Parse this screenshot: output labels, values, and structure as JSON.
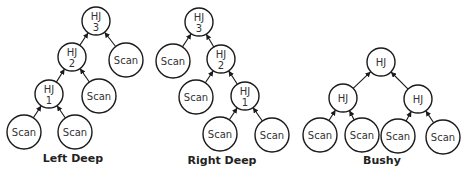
{
  "diagram": {
    "colors": {
      "stroke": "#1a1a1a",
      "text": "#333333",
      "background": "#ffffff"
    },
    "trees": [
      {
        "id": "left-deep",
        "caption": "Left Deep",
        "caption_pos": [
          73,
          162
        ],
        "nodes": [
          {
            "id": "hj3",
            "line1": "HJ",
            "line2": "3",
            "x": 96,
            "y": 21,
            "r": 14
          },
          {
            "id": "hj2",
            "line1": "HJ",
            "line2": "2",
            "x": 72,
            "y": 57,
            "r": 14
          },
          {
            "id": "scan_a",
            "line1": "Scan",
            "line2": "",
            "x": 126,
            "y": 60,
            "r": 17
          },
          {
            "id": "hj1",
            "line1": "HJ",
            "line2": "1",
            "x": 49,
            "y": 94,
            "r": 14
          },
          {
            "id": "scan_b",
            "line1": "Scan",
            "line2": "",
            "x": 99,
            "y": 96,
            "r": 17
          },
          {
            "id": "scan_c",
            "line1": "Scan",
            "line2": "",
            "x": 24,
            "y": 132,
            "r": 17
          },
          {
            "id": "scan_d",
            "line1": "Scan",
            "line2": "",
            "x": 75,
            "y": 132,
            "r": 17
          }
        ],
        "edges": [
          [
            "hj2",
            "hj3"
          ],
          [
            "scan_a",
            "hj3"
          ],
          [
            "hj1",
            "hj2"
          ],
          [
            "scan_b",
            "hj2"
          ],
          [
            "scan_c",
            "hj1"
          ],
          [
            "scan_d",
            "hj1"
          ]
        ]
      },
      {
        "id": "right-deep",
        "caption": "Right Deep",
        "caption_pos": [
          222,
          164
        ],
        "nodes": [
          {
            "id": "hj3",
            "line1": "HJ",
            "line2": "3",
            "x": 199,
            "y": 22,
            "r": 14
          },
          {
            "id": "scan_a",
            "line1": "Scan",
            "line2": "",
            "x": 173,
            "y": 61,
            "r": 17
          },
          {
            "id": "hj2",
            "line1": "HJ",
            "line2": "2",
            "x": 221,
            "y": 59,
            "r": 14
          },
          {
            "id": "scan_b",
            "line1": "Scan",
            "line2": "",
            "x": 196,
            "y": 97,
            "r": 17
          },
          {
            "id": "hj1",
            "line1": "HJ",
            "line2": "1",
            "x": 245,
            "y": 96,
            "r": 14
          },
          {
            "id": "scan_c",
            "line1": "Scan",
            "line2": "",
            "x": 220,
            "y": 134,
            "r": 17
          },
          {
            "id": "scan_d",
            "line1": "Scan",
            "line2": "",
            "x": 272,
            "y": 135,
            "r": 17
          }
        ],
        "edges": [
          [
            "scan_a",
            "hj3"
          ],
          [
            "hj2",
            "hj3"
          ],
          [
            "scan_b",
            "hj2"
          ],
          [
            "hj1",
            "hj2"
          ],
          [
            "scan_c",
            "hj1"
          ],
          [
            "scan_d",
            "hj1"
          ]
        ]
      },
      {
        "id": "bushy",
        "caption": "Bushy",
        "caption_pos": [
          382,
          164
        ],
        "nodes": [
          {
            "id": "hj_top",
            "line1": "HJ",
            "line2": "",
            "x": 381,
            "y": 62,
            "r": 14
          },
          {
            "id": "hj_left",
            "line1": "HJ",
            "line2": "",
            "x": 343,
            "y": 98,
            "r": 14
          },
          {
            "id": "hj_right",
            "line1": "HJ",
            "line2": "",
            "x": 418,
            "y": 99,
            "r": 14
          },
          {
            "id": "scan_a",
            "line1": "Scan",
            "line2": "",
            "x": 320,
            "y": 135,
            "r": 17
          },
          {
            "id": "scan_b",
            "line1": "Scan",
            "line2": "",
            "x": 362,
            "y": 135,
            "r": 17
          },
          {
            "id": "scan_c",
            "line1": "Scan",
            "line2": "",
            "x": 398,
            "y": 136,
            "r": 17
          },
          {
            "id": "scan_d",
            "line1": "Scan",
            "line2": "",
            "x": 443,
            "y": 137,
            "r": 17
          }
        ],
        "edges": [
          [
            "hj_left",
            "hj_top"
          ],
          [
            "hj_right",
            "hj_top"
          ],
          [
            "scan_a",
            "hj_left"
          ],
          [
            "scan_b",
            "hj_left"
          ],
          [
            "scan_c",
            "hj_right"
          ],
          [
            "scan_d",
            "hj_right"
          ]
        ]
      }
    ]
  }
}
